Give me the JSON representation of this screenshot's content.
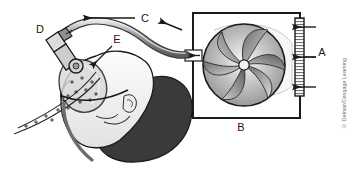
{
  "figure": {
    "background": "#ffffff",
    "line_color": "#1a1a1a"
  },
  "labels": {
    "a": "A",
    "b": "B",
    "c": "C",
    "d": "D",
    "e": "E"
  },
  "label_meanings": {
    "a": "air intake filter",
    "b": "blower unit housing",
    "c": "flexible delivery tubing",
    "d": "elbow connector",
    "e": "nasal mask"
  },
  "credit": {
    "text": "© Delmar/Cengage Learning",
    "color": "#6e6e6e"
  },
  "colors": {
    "outline": "#1a1a1a",
    "fan_light": "#f0f0f0",
    "fan_mid": "#9a9a9a",
    "fan_dark": "#4a4a4a",
    "hair": "#3a3a3a",
    "skin": "#f2f2f2",
    "mask_shade": "#c9c9c9",
    "tube": "#8d8d8d"
  },
  "elements": {
    "filter_label": "filter strip with three intake arrows",
    "fan_label": "impeller fan with curved blades",
    "box_label": "blower housing rectangle",
    "tube_label": "corrugated air tube arc",
    "arrow_c_left": "flow arrow pointing left",
    "arrow_c_right": "flow arrow pointing left from machine",
    "arrow_inlet": "arrow into blower inlet port"
  }
}
